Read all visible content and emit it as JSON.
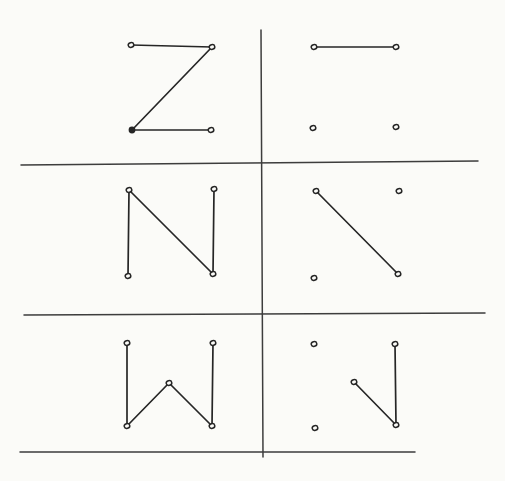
{
  "figure": {
    "canvas": {
      "width": 505,
      "height": 481
    },
    "colors": {
      "paper": "#fbfbf8",
      "ink": "#262626",
      "grid_ink": "#3d3d3d"
    },
    "style": {
      "letter_stroke_width": 1.7,
      "grid_stroke_width": 1.5,
      "dot_rx": 2.8,
      "dot_ry": 2.3,
      "dot_stroke_width": 1.5,
      "filled_dot_r": 3.4
    },
    "grid": {
      "vertical_line": {
        "x1": 261,
        "y1": 30,
        "x2": 263,
        "y2": 457
      },
      "horizontal_lines": [
        {
          "x1": 21,
          "y1": 165,
          "x2": 478,
          "y2": 161
        },
        {
          "x1": 24,
          "y1": 315,
          "x2": 485,
          "y2": 313
        },
        {
          "x1": 20,
          "y1": 452,
          "x2": 415,
          "y2": 452
        }
      ]
    },
    "panels": [
      {
        "id": "letter-z-complete",
        "row": 1,
        "column": "left",
        "dots": [
          {
            "x": 131,
            "y": 45,
            "filled": false
          },
          {
            "x": 212,
            "y": 47,
            "filled": false
          },
          {
            "x": 132,
            "y": 130,
            "filled": true
          },
          {
            "x": 211,
            "y": 130,
            "filled": false
          }
        ],
        "segments": [
          [
            0,
            1
          ],
          [
            1,
            2
          ],
          [
            2,
            3
          ]
        ]
      },
      {
        "id": "letter-z-partial",
        "row": 1,
        "column": "right",
        "dots": [
          {
            "x": 314,
            "y": 47,
            "filled": false
          },
          {
            "x": 396,
            "y": 47,
            "filled": false
          },
          {
            "x": 313,
            "y": 128,
            "filled": false
          },
          {
            "x": 396,
            "y": 127,
            "filled": false
          }
        ],
        "segments": [
          [
            0,
            1
          ]
        ]
      },
      {
        "id": "letter-n-complete",
        "row": 2,
        "column": "left",
        "dots": [
          {
            "x": 129,
            "y": 190,
            "filled": false
          },
          {
            "x": 214,
            "y": 189,
            "filled": false
          },
          {
            "x": 128,
            "y": 276,
            "filled": false
          },
          {
            "x": 213,
            "y": 274,
            "filled": false
          }
        ],
        "segments": [
          [
            0,
            2
          ],
          [
            0,
            3
          ],
          [
            1,
            3
          ]
        ]
      },
      {
        "id": "letter-n-partial",
        "row": 2,
        "column": "right",
        "dots": [
          {
            "x": 316,
            "y": 191,
            "filled": false
          },
          {
            "x": 399,
            "y": 191,
            "filled": false
          },
          {
            "x": 314,
            "y": 278,
            "filled": false
          },
          {
            "x": 398,
            "y": 274,
            "filled": false
          }
        ],
        "segments": [
          [
            0,
            3
          ]
        ]
      },
      {
        "id": "letter-w-complete",
        "row": 3,
        "column": "left",
        "dots": [
          {
            "x": 127,
            "y": 343,
            "filled": false
          },
          {
            "x": 213,
            "y": 343,
            "filled": false
          },
          {
            "x": 169,
            "y": 383,
            "filled": false
          },
          {
            "x": 127,
            "y": 426,
            "filled": false
          },
          {
            "x": 212,
            "y": 426,
            "filled": false
          }
        ],
        "segments": [
          [
            0,
            3
          ],
          [
            3,
            2
          ],
          [
            2,
            4
          ],
          [
            4,
            1
          ]
        ]
      },
      {
        "id": "letter-w-partial",
        "row": 3,
        "column": "right",
        "dots": [
          {
            "x": 314,
            "y": 344,
            "filled": false
          },
          {
            "x": 395,
            "y": 344,
            "filled": false
          },
          {
            "x": 354,
            "y": 382,
            "filled": false
          },
          {
            "x": 315,
            "y": 428,
            "filled": false
          },
          {
            "x": 396,
            "y": 425,
            "filled": false
          }
        ],
        "segments": [
          [
            2,
            4
          ],
          [
            4,
            1
          ]
        ]
      }
    ]
  }
}
